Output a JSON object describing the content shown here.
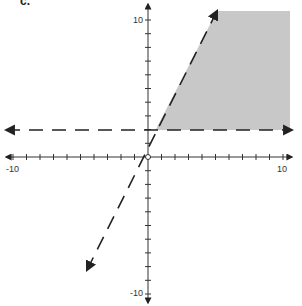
{
  "problem": {
    "label": "c."
  },
  "chart_data": {
    "type": "inequality-graph",
    "title": "",
    "xlabel": "",
    "ylabel": "",
    "xlim": [
      -10,
      10
    ],
    "ylim": [
      -10,
      10
    ],
    "tick_step": 1,
    "tick_labels": {
      "x_min": "-10",
      "x_max": "10",
      "y_min": "-10",
      "y_max": "10"
    },
    "grid": false,
    "boundaries": [
      {
        "name": "horizontal-line",
        "equation": "y = 2",
        "style": "dashed",
        "direction": "both"
      },
      {
        "name": "slanted-line",
        "equation": "y = 2x + 1",
        "style": "dashed",
        "direction": "both"
      }
    ],
    "shaded_region": {
      "description": "y > 2 and y < 2x + 1",
      "color": "#c8c8c8"
    },
    "origin_marker": "open-circle",
    "colors": {
      "axis": "#333333",
      "line": "#222222",
      "shade": "#c8c8c8"
    }
  }
}
